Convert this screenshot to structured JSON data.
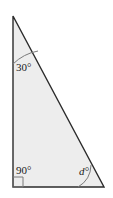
{
  "figure": {
    "type": "geometry-diagram",
    "shape": "right-triangle",
    "fill_color": "#ededed",
    "stroke_color": "#2b2b2b",
    "background_color": "#ffffff",
    "arc_color": "#7a7a7a"
  },
  "vertices": {
    "top": {
      "x": 13,
      "y": 16
    },
    "bottom_left": {
      "x": 13,
      "y": 187
    },
    "bottom_right": {
      "x": 104,
      "y": 187
    }
  },
  "angles": {
    "top": {
      "label": "30°",
      "value": 30,
      "marker": "arc",
      "vertex": "top"
    },
    "bottom_left": {
      "label": "90°",
      "value": 90,
      "marker": "right-angle-square",
      "vertex": "bottom_left"
    },
    "bottom_right": {
      "label": "d°",
      "value": null,
      "marker": "arc",
      "vertex": "bottom_right"
    }
  },
  "geometry": {
    "triangle_points": "13,16 13,187 104,187",
    "arc_top_path": "M 13,64 A 48,48 0 0 1 38,51",
    "arc_bottom_right_path": "M 78,187 A 26,26 0 0 0 91,165",
    "right_angle_square_points": "13,177 23,177 23,187 13,187"
  }
}
